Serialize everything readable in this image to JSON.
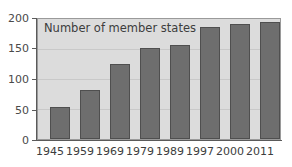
{
  "chart_data": {
    "type": "bar",
    "title": "Number of member states",
    "title_position": "inside-top-left",
    "xlabel": "",
    "ylabel": "",
    "categories": [
      "1945",
      "1959",
      "1969",
      "1979",
      "1989",
      "1997",
      "2000",
      "2011"
    ],
    "values": [
      54,
      82,
      125,
      151,
      157,
      187,
      192,
      195
    ],
    "ylim": [
      0,
      200
    ],
    "yticks": [
      0,
      50,
      100,
      150,
      200
    ],
    "ytick_labels": [
      "0",
      "50",
      "100",
      "150",
      "200"
    ],
    "grid": true,
    "legend": false,
    "series": [
      {
        "name": "Number of member states",
        "values": [
          54,
          82,
          125,
          151,
          157,
          187,
          192,
          195
        ]
      }
    ],
    "colors": {
      "bar_fill": "#6e6e6e",
      "bar_edge": "#4f4f4f",
      "plot_background": "#dcdcdc",
      "figure_background": "#ffffff",
      "axis": "#5a5a5a",
      "gridline": "#c9c9c9",
      "text": "#3d3d3d"
    }
  }
}
